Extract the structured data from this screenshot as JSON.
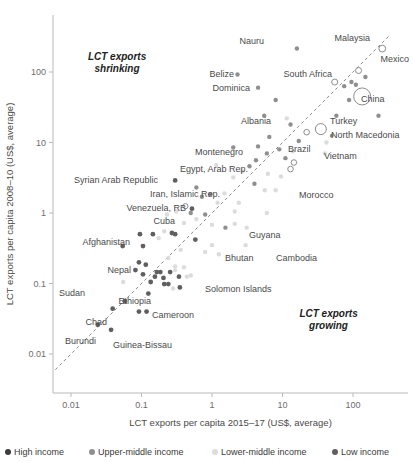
{
  "chart_data": {
    "type": "scatter",
    "title": "",
    "xlabel": "LCT exports per capita 2015–17 (US$, average)",
    "ylabel": "LCT exports per capita 2008–10 (US$, average)",
    "xscale": "log",
    "yscale": "log",
    "xlim": [
      0.005,
      400
    ],
    "ylim": [
      0.005,
      400
    ],
    "xticks": [
      "0.01",
      "0.1",
      "1",
      "10",
      "100"
    ],
    "xtick_values": [
      0.01,
      0.1,
      1,
      10,
      100
    ],
    "yticks": [
      "0.01",
      "0.1",
      "1",
      "10",
      "100"
    ],
    "ytick_values": [
      0.01,
      0.1,
      1,
      10,
      100
    ],
    "grid": false,
    "reference_line": {
      "name": "45-degree parity line",
      "style": "dashed",
      "equation": "y = x"
    },
    "annotations": [
      {
        "text_line1": "LCT exports",
        "text_line2": "shrinking",
        "x": 0.045,
        "y": 150,
        "name": "quadrant-note-shrinking"
      },
      {
        "text_line1": "LCT exports",
        "text_line2": "growing",
        "x": 45,
        "y": 0.033,
        "name": "quadrant-note-growing"
      }
    ],
    "legend": {
      "position": "bottom",
      "entries": [
        {
          "label": "High income",
          "color": "#3d3d3d",
          "key": "high"
        },
        {
          "label": "Upper-middle income",
          "color": "#8f8f8f",
          "key": "upper-middle"
        },
        {
          "label": "Lower-middle income",
          "color": "#dcdcdc",
          "key": "lower-middle"
        },
        {
          "label": "Low income",
          "color": "#5f5f5f",
          "key": "low"
        }
      ]
    },
    "labeled_points": [
      {
        "label": "Nauru",
        "x": 16.0,
        "y": 215,
        "group": "upper-middle",
        "r": 2.2,
        "open": false,
        "lx": 264,
        "ly": 44,
        "anchor": "end"
      },
      {
        "label": "Malaysia",
        "x": 260,
        "y": 215,
        "group": "high",
        "r": 3.4,
        "open": true,
        "lx": 370,
        "ly": 41,
        "anchor": "end"
      },
      {
        "label": "Mexico",
        "x": 120,
        "y": 105,
        "group": "high",
        "r": 3.0,
        "open": true,
        "lx": 409,
        "ly": 62,
        "anchor": "end"
      },
      {
        "label": "Belize",
        "x": 2.3,
        "y": 92,
        "group": "upper-middle",
        "r": 2.2,
        "open": false,
        "lx": 234,
        "ly": 77,
        "anchor": "end"
      },
      {
        "label": "South Africa",
        "x": 55,
        "y": 72,
        "group": "high",
        "r": 3.0,
        "open": true,
        "lx": 332,
        "ly": 77,
        "anchor": "end"
      },
      {
        "label": "Dominica",
        "x": 4.5,
        "y": 60,
        "group": "upper-middle",
        "r": 2.2,
        "open": false,
        "lx": 250,
        "ly": 91,
        "anchor": "end"
      },
      {
        "label": "China",
        "x": 135,
        "y": 45,
        "group": "upper-middle",
        "r": 8.5,
        "open": true,
        "lx": 361,
        "ly": 102,
        "anchor": "start"
      },
      {
        "label": "Turkey",
        "x": 58,
        "y": 24,
        "group": "upper-middle",
        "r": 2.2,
        "open": false,
        "lx": 330,
        "ly": 124,
        "anchor": "start"
      },
      {
        "label": "Albania",
        "x": 5.5,
        "y": 24,
        "group": "upper-middle",
        "r": 2.2,
        "open": false,
        "lx": 271,
        "ly": 124,
        "anchor": "end"
      },
      {
        "label": "North Macedonia",
        "x": 50,
        "y": 12.5,
        "group": "upper-middle",
        "r": 2.0,
        "open": false,
        "lx": 331,
        "ly": 138,
        "anchor": "start"
      },
      {
        "label": "Brazil",
        "x": 17,
        "y": 10.5,
        "group": "upper-middle",
        "r": 2.2,
        "open": false,
        "lx": 288,
        "ly": 152,
        "anchor": "start"
      },
      {
        "label": "Montenegro",
        "x": 2.0,
        "y": 8.5,
        "group": "upper-middle",
        "r": 2.2,
        "open": false,
        "lx": 243,
        "ly": 155,
        "anchor": "end"
      },
      {
        "label": "Vietnam",
        "x": 40,
        "y": 7.0,
        "group": "lower-middle",
        "r": 2.2,
        "open": false,
        "lx": 324,
        "ly": 159,
        "anchor": "start"
      },
      {
        "label": "Egypt, Arab Rep.",
        "x": 1.15,
        "y": 4.8,
        "group": "lower-middle",
        "r": 2.2,
        "open": false,
        "lx": 248,
        "ly": 172,
        "anchor": "end"
      },
      {
        "label": "Syrian Arab Republic",
        "x": 0.3,
        "y": 2.9,
        "group": "low",
        "r": 2.4,
        "open": false,
        "lx": 158,
        "ly": 183,
        "anchor": "end"
      },
      {
        "label": "Iran, Islamic Rep.",
        "x": 0.6,
        "y": 2.3,
        "group": "upper-middle",
        "r": 2.2,
        "open": false,
        "lx": 220,
        "ly": 197,
        "anchor": "end"
      },
      {
        "label": "Morocco",
        "x": 8.0,
        "y": 2.1,
        "group": "lower-middle",
        "r": 2.2,
        "open": false,
        "lx": 299,
        "ly": 198,
        "anchor": "start"
      },
      {
        "label": "Venezuela, RB",
        "x": 0.42,
        "y": 1.25,
        "group": "high",
        "r": 2.6,
        "open": true,
        "lx": 186,
        "ly": 211,
        "anchor": "end"
      },
      {
        "label": "Cuba",
        "x": 0.5,
        "y": 1.0,
        "group": "upper-middle",
        "r": 2.2,
        "open": false,
        "lx": 175,
        "ly": 224,
        "anchor": "end"
      },
      {
        "label": "Guyana",
        "x": 1.55,
        "y": 0.62,
        "group": "upper-middle",
        "r": 2.2,
        "open": false,
        "lx": 249,
        "ly": 238,
        "anchor": "start"
      },
      {
        "label": "Afghanistan",
        "x": 0.095,
        "y": 0.5,
        "group": "low",
        "r": 2.4,
        "open": false,
        "lx": 130,
        "ly": 245,
        "anchor": "end"
      },
      {
        "label": "Bhutan",
        "x": 1.0,
        "y": 0.35,
        "group": "lower-middle",
        "r": 2.2,
        "open": false,
        "lx": 225,
        "ly": 261,
        "anchor": "start"
      },
      {
        "label": "Cambodia",
        "x": 3.0,
        "y": 0.35,
        "group": "lower-middle",
        "r": 2.2,
        "open": false,
        "lx": 276,
        "ly": 261,
        "anchor": "start"
      },
      {
        "label": "Nepal",
        "x": 0.092,
        "y": 0.2,
        "group": "low",
        "r": 2.4,
        "open": false,
        "lx": 131,
        "ly": 273,
        "anchor": "end"
      },
      {
        "label": "Solomon Islands",
        "x": 0.5,
        "y": 0.13,
        "group": "lower-middle",
        "r": 2.2,
        "open": false,
        "lx": 205,
        "ly": 292,
        "anchor": "start"
      },
      {
        "label": "Sudan",
        "x": 0.055,
        "y": 0.105,
        "group": "lower-middle",
        "r": 2.2,
        "open": false,
        "lx": 85,
        "ly": 296,
        "anchor": "end"
      },
      {
        "label": "Ethiopia",
        "x": 0.135,
        "y": 0.105,
        "group": "low",
        "r": 2.4,
        "open": false,
        "lx": 151,
        "ly": 304,
        "anchor": "end"
      },
      {
        "label": "Cameroon",
        "x": 0.28,
        "y": 0.085,
        "group": "lower-middle",
        "r": 2.2,
        "open": false,
        "lx": 152,
        "ly": 318,
        "anchor": "start"
      },
      {
        "label": "Chad",
        "x": 0.039,
        "y": 0.044,
        "group": "low",
        "r": 2.4,
        "open": false,
        "lx": 107,
        "ly": 325,
        "anchor": "end"
      },
      {
        "label": "Burundi",
        "x": 0.024,
        "y": 0.026,
        "group": "low",
        "r": 2.4,
        "open": false,
        "lx": 96,
        "ly": 344,
        "anchor": "end"
      },
      {
        "label": "Guinea-Bissau",
        "x": 0.037,
        "y": 0.022,
        "group": "low",
        "r": 2.4,
        "open": false,
        "lx": 113,
        "ly": 348,
        "anchor": "start"
      }
    ],
    "unlabeled_points": [
      {
        "x": 230,
        "y": 24,
        "group": "upper-middle",
        "r": 2.2,
        "open": false
      },
      {
        "x": 95,
        "y": 72,
        "group": "upper-middle",
        "r": 2.2,
        "open": false
      },
      {
        "x": 150,
        "y": 85,
        "group": "upper-middle",
        "r": 2.2,
        "open": false
      },
      {
        "x": 110,
        "y": 66,
        "group": "upper-middle",
        "r": 2.2,
        "open": false
      },
      {
        "x": 75,
        "y": 63,
        "group": "upper-middle",
        "r": 2.2,
        "open": false
      },
      {
        "x": 88,
        "y": 40,
        "group": "upper-middle",
        "r": 2.2,
        "open": false
      },
      {
        "x": 8.0,
        "y": 40,
        "group": "upper-middle",
        "r": 2.2,
        "open": false
      },
      {
        "x": 11.5,
        "y": 22,
        "group": "lower-middle",
        "r": 2.2,
        "open": false
      },
      {
        "x": 13.0,
        "y": 18,
        "group": "upper-middle",
        "r": 2.2,
        "open": false
      },
      {
        "x": 35,
        "y": 15.5,
        "group": "upper-middle",
        "r": 5.5,
        "open": true
      },
      {
        "x": 22,
        "y": 14,
        "group": "upper-middle",
        "r": 2.8,
        "open": true
      },
      {
        "x": 6.5,
        "y": 12,
        "group": "upper-middle",
        "r": 2.2,
        "open": false
      },
      {
        "x": 42,
        "y": 10.0,
        "group": "lower-middle",
        "r": 2.2,
        "open": false
      },
      {
        "x": 4.5,
        "y": 8.8,
        "group": "upper-middle",
        "r": 2.2,
        "open": false
      },
      {
        "x": 9.0,
        "y": 8.0,
        "group": "upper-middle",
        "r": 2.2,
        "open": false
      },
      {
        "x": 14,
        "y": 7.5,
        "group": "lower-middle",
        "r": 2.2,
        "open": false
      },
      {
        "x": 6.0,
        "y": 7.0,
        "group": "upper-middle",
        "r": 2.2,
        "open": false
      },
      {
        "x": 11,
        "y": 6.0,
        "group": "upper-middle",
        "r": 2.2,
        "open": false
      },
      {
        "x": 14.5,
        "y": 5.2,
        "group": "upper-middle",
        "r": 2.8,
        "open": true
      },
      {
        "x": 4.2,
        "y": 5.6,
        "group": "upper-middle",
        "r": 2.2,
        "open": false
      },
      {
        "x": 3.4,
        "y": 4.6,
        "group": "upper-middle",
        "r": 2.2,
        "open": false
      },
      {
        "x": 2.7,
        "y": 3.9,
        "group": "lower-middle",
        "r": 2.2,
        "open": false
      },
      {
        "x": 6.2,
        "y": 3.6,
        "group": "lower-middle",
        "r": 2.2,
        "open": false
      },
      {
        "x": 9.5,
        "y": 3.3,
        "group": "lower-middle",
        "r": 2.2,
        "open": false
      },
      {
        "x": 13,
        "y": 4.2,
        "group": "lower-middle",
        "r": 2.8,
        "open": true
      },
      {
        "x": 2.0,
        "y": 3.2,
        "group": "lower-middle",
        "r": 2.2,
        "open": false
      },
      {
        "x": 4.0,
        "y": 2.6,
        "group": "upper-middle",
        "r": 2.2,
        "open": false
      },
      {
        "x": 5.6,
        "y": 2.1,
        "group": "lower-middle",
        "r": 2.2,
        "open": false
      },
      {
        "x": 1.5,
        "y": 1.9,
        "group": "lower-middle",
        "r": 2.2,
        "open": false
      },
      {
        "x": 0.95,
        "y": 1.85,
        "group": "upper-middle",
        "r": 2.2,
        "open": false
      },
      {
        "x": 0.72,
        "y": 1.7,
        "group": "upper-middle",
        "r": 2.2,
        "open": false
      },
      {
        "x": 1.2,
        "y": 1.4,
        "group": "lower-middle",
        "r": 2.2,
        "open": false
      },
      {
        "x": 2.4,
        "y": 1.4,
        "group": "lower-middle",
        "r": 2.2,
        "open": false
      },
      {
        "x": 0.52,
        "y": 1.15,
        "group": "low",
        "r": 2.4,
        "open": false
      },
      {
        "x": 0.31,
        "y": 1.05,
        "group": "lower-middle",
        "r": 2.2,
        "open": false
      },
      {
        "x": 0.23,
        "y": 0.95,
        "group": "lower-middle",
        "r": 2.2,
        "open": false
      },
      {
        "x": 0.8,
        "y": 0.95,
        "group": "upper-middle",
        "r": 2.2,
        "open": false
      },
      {
        "x": 2.1,
        "y": 1.05,
        "group": "lower-middle",
        "r": 2.2,
        "open": false
      },
      {
        "x": 6.0,
        "y": 1.0,
        "group": "lower-middle",
        "r": 2.2,
        "open": false
      },
      {
        "x": 0.4,
        "y": 0.72,
        "group": "lower-middle",
        "r": 2.2,
        "open": false
      },
      {
        "x": 0.6,
        "y": 0.82,
        "group": "lower-middle",
        "r": 2.2,
        "open": false
      },
      {
        "x": 1.0,
        "y": 0.68,
        "group": "lower-middle",
        "r": 2.2,
        "open": false
      },
      {
        "x": 2.1,
        "y": 0.7,
        "group": "lower-middle",
        "r": 2.2,
        "open": false
      },
      {
        "x": 3.1,
        "y": 0.62,
        "group": "lower-middle",
        "r": 2.2,
        "open": false
      },
      {
        "x": 0.21,
        "y": 0.55,
        "group": "lower-middle",
        "r": 2.2,
        "open": false
      },
      {
        "x": 0.27,
        "y": 0.52,
        "group": "low",
        "r": 2.4,
        "open": false
      },
      {
        "x": 0.3,
        "y": 0.5,
        "group": "low",
        "r": 2.4,
        "open": false
      },
      {
        "x": 0.145,
        "y": 0.5,
        "group": "low",
        "r": 2.4,
        "open": false
      },
      {
        "x": 0.175,
        "y": 0.44,
        "group": "lower-middle",
        "r": 2.2,
        "open": false
      },
      {
        "x": 0.58,
        "y": 0.42,
        "group": "low",
        "r": 2.4,
        "open": false
      },
      {
        "x": 0.105,
        "y": 0.34,
        "group": "low",
        "r": 2.4,
        "open": false
      },
      {
        "x": 0.36,
        "y": 0.3,
        "group": "lower-middle",
        "r": 2.2,
        "open": false
      },
      {
        "x": 0.8,
        "y": 0.28,
        "group": "lower-middle",
        "r": 2.2,
        "open": false
      },
      {
        "x": 1.25,
        "y": 0.26,
        "group": "lower-middle",
        "r": 2.2,
        "open": false
      },
      {
        "x": 0.24,
        "y": 0.23,
        "group": "lower-middle",
        "r": 2.2,
        "open": false
      },
      {
        "x": 0.115,
        "y": 0.185,
        "group": "low",
        "r": 2.4,
        "open": false
      },
      {
        "x": 0.3,
        "y": 0.175,
        "group": "lower-middle",
        "r": 2.2,
        "open": false
      },
      {
        "x": 0.4,
        "y": 0.17,
        "group": "lower-middle",
        "r": 2.2,
        "open": false
      },
      {
        "x": 0.165,
        "y": 0.145,
        "group": "low",
        "r": 2.4,
        "open": false
      },
      {
        "x": 0.185,
        "y": 0.145,
        "group": "low",
        "r": 2.4,
        "open": false
      },
      {
        "x": 0.255,
        "y": 0.145,
        "group": "low",
        "r": 2.4,
        "open": false
      },
      {
        "x": 0.3,
        "y": 0.155,
        "group": "lower-middle",
        "r": 2.2,
        "open": false
      },
      {
        "x": 0.105,
        "y": 0.135,
        "group": "low",
        "r": 2.4,
        "open": false
      },
      {
        "x": 0.155,
        "y": 0.125,
        "group": "low",
        "r": 2.4,
        "open": false
      },
      {
        "x": 0.205,
        "y": 0.12,
        "group": "low",
        "r": 2.4,
        "open": false
      },
      {
        "x": 0.44,
        "y": 0.125,
        "group": "lower-middle",
        "r": 2.2,
        "open": false
      },
      {
        "x": 0.34,
        "y": 0.125,
        "group": "low",
        "r": 2.4,
        "open": false
      },
      {
        "x": 0.21,
        "y": 0.098,
        "group": "low",
        "r": 2.4,
        "open": false
      },
      {
        "x": 0.24,
        "y": 0.098,
        "group": "low",
        "r": 2.4,
        "open": false
      },
      {
        "x": 0.35,
        "y": 0.088,
        "group": "low",
        "r": 2.4,
        "open": false
      },
      {
        "x": 0.125,
        "y": 0.072,
        "group": "low",
        "r": 2.4,
        "open": false
      },
      {
        "x": 0.058,
        "y": 0.056,
        "group": "low",
        "r": 2.4,
        "open": false
      },
      {
        "x": 0.092,
        "y": 0.04,
        "group": "low",
        "r": 2.4,
        "open": false
      },
      {
        "x": 0.118,
        "y": 0.04,
        "group": "low",
        "r": 2.4,
        "open": false
      },
      {
        "x": 0.054,
        "y": 0.34,
        "group": "low",
        "r": 2.4,
        "open": false
      },
      {
        "x": 0.082,
        "y": 0.155,
        "group": "low",
        "r": 2.4,
        "open": false
      }
    ]
  }
}
